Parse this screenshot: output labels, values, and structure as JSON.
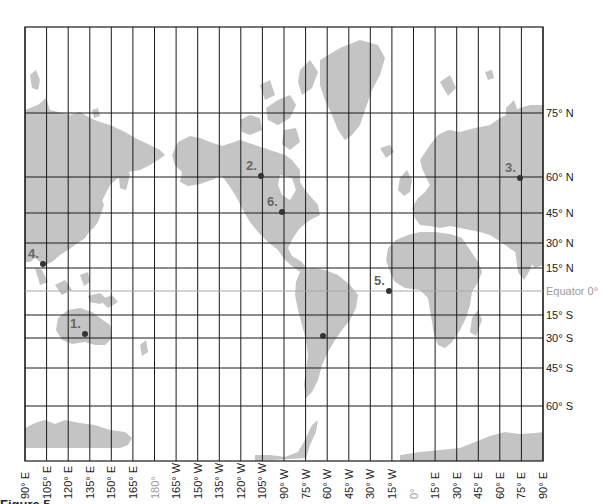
{
  "map": {
    "projection": "Mercator",
    "frame": {
      "left": 25,
      "right": 543,
      "top": 27,
      "bottom": 461
    },
    "colors": {
      "land": "#c4c4c4",
      "grid": "#1a1a1a",
      "equator": "#a8a8a8",
      "label": "#222222",
      "muted_label": "#9a9a9a",
      "point_label": "#666666",
      "point": "#333333"
    },
    "longitudes": [
      {
        "label": "90° E",
        "x": 25
      },
      {
        "label": "105° E",
        "x": 46.6
      },
      {
        "label": "120° E",
        "x": 68.2
      },
      {
        "label": "135° E",
        "x": 89.8
      },
      {
        "label": "150° E",
        "x": 111.3
      },
      {
        "label": "165° E",
        "x": 132.9
      },
      {
        "label": "180°",
        "x": 154.5,
        "muted": true
      },
      {
        "label": "165° W",
        "x": 176.1
      },
      {
        "label": "150° W",
        "x": 197.7
      },
      {
        "label": "135° W",
        "x": 219.3
      },
      {
        "label": "120° W",
        "x": 240.8
      },
      {
        "label": "105° W",
        "x": 262.4
      },
      {
        "label": "90° W",
        "x": 284
      },
      {
        "label": "75° W",
        "x": 305.6
      },
      {
        "label": "60° W",
        "x": 327.2
      },
      {
        "label": "45° W",
        "x": 348.8
      },
      {
        "label": "30° W",
        "x": 370.3
      },
      {
        "label": "15° W",
        "x": 391.9
      },
      {
        "label": "0°",
        "x": 413.5,
        "muted": true
      },
      {
        "label": "15° E",
        "x": 435.1
      },
      {
        "label": "30° E",
        "x": 456.7
      },
      {
        "label": "45° E",
        "x": 478.3
      },
      {
        "label": "60° E",
        "x": 499.8
      },
      {
        "label": "75° E",
        "x": 521.4
      },
      {
        "label": "90° E",
        "x": 543
      }
    ],
    "latitudes": [
      {
        "label": "75° N",
        "y": 113
      },
      {
        "label": "60° N",
        "y": 177
      },
      {
        "label": "45° N",
        "y": 213
      },
      {
        "label": "30° N",
        "y": 243
      },
      {
        "label": "15° N",
        "y": 268
      },
      {
        "label": "Equator 0°",
        "y": 291,
        "muted": true
      },
      {
        "label": "15° S",
        "y": 315
      },
      {
        "label": "30° S",
        "y": 338
      },
      {
        "label": "45° S",
        "y": 368
      },
      {
        "label": "60° S",
        "y": 406
      }
    ],
    "points": [
      {
        "label": "1.",
        "x": 85,
        "y": 334
      },
      {
        "label": "2.",
        "x": 261,
        "y": 176
      },
      {
        "label": "3.",
        "x": 520,
        "y": 178
      },
      {
        "label": "4.",
        "x": 43,
        "y": 264
      },
      {
        "label": "5.",
        "x": 389,
        "y": 291
      },
      {
        "label": "6.",
        "x": 282,
        "y": 212
      },
      {
        "label": "",
        "x": 323,
        "y": 336
      }
    ]
  },
  "caption": "Figure 5"
}
